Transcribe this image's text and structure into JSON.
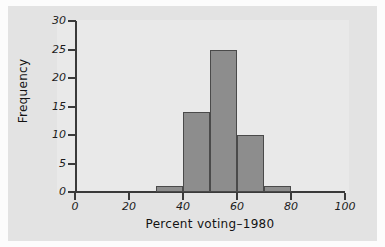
{
  "chart_data": {
    "type": "bar",
    "title": "",
    "subtitle": "",
    "xlabel": "Percent voting–1980",
    "ylabel": "Frequency",
    "bin_width": 10,
    "bin_edges": [
      30,
      40,
      50,
      60,
      70,
      80
    ],
    "categories": [
      "30–40",
      "40–50",
      "50–60",
      "60–70",
      "70–80"
    ],
    "values": [
      1,
      14,
      25,
      10,
      1
    ],
    "bars": [
      {
        "bin_start": 30,
        "bin_end": 40,
        "value": 1
      },
      {
        "bin_start": 40,
        "bin_end": 50,
        "value": 14
      },
      {
        "bin_start": 50,
        "bin_end": 60,
        "value": 25
      },
      {
        "bin_start": 60,
        "bin_end": 70,
        "value": 10
      },
      {
        "bin_start": 70,
        "bin_end": 80,
        "value": 1
      }
    ],
    "xlim": [
      0,
      100
    ],
    "ylim": [
      0,
      30
    ],
    "xticks": [
      0,
      20,
      40,
      60,
      80,
      100
    ],
    "yticks": [
      0,
      5,
      10,
      15,
      20,
      25,
      30
    ],
    "xtick_labels": [
      "0",
      "20",
      "40",
      "60",
      "80",
      "100"
    ],
    "ytick_labels": [
      "0",
      "5",
      "10",
      "15",
      "20",
      "25",
      "30"
    ],
    "grid": false,
    "legend": null,
    "legend_position": "none",
    "annotations": [],
    "colors": {
      "bar_fill": "#8d8d8d",
      "bar_edge": "#4a4a4a",
      "axis": "#3a3a3a",
      "text": "#131313",
      "plot_background": "#e9e9e9",
      "figure_background": "#e3e3e3",
      "page_background": "#fcfcfc"
    }
  }
}
